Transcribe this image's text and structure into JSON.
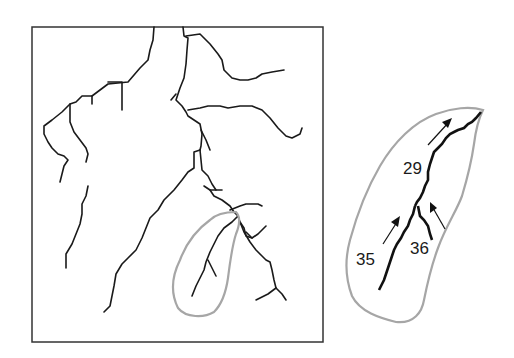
{
  "figure": {
    "colors": {
      "streams": "#1a1a1a",
      "basin_outline": "#a6a6a6",
      "frame": "#333333",
      "background": "#ffffff"
    }
  },
  "inset": {
    "labels": [
      {
        "id": "segment-29",
        "text": "29"
      },
      {
        "id": "segment-35",
        "text": "35"
      },
      {
        "id": "segment-36",
        "text": "36"
      }
    ],
    "arrows": [
      "flow-arrow-downstream",
      "flow-arrow-left-tributary",
      "flow-arrow-right-tributary"
    ]
  }
}
